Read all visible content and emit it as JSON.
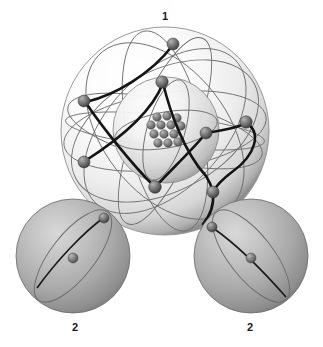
{
  "figure": {
    "title_present": false,
    "background_color": "#ffffff",
    "labels": [
      {
        "text": "1",
        "refers_to": "large-atom",
        "position": "top-center"
      },
      {
        "text": "2",
        "refers_to": "small-atom-left",
        "position": "bottom-left"
      },
      {
        "text": "2",
        "refers_to": "small-atom-right",
        "position": "bottom-right"
      }
    ],
    "label_1": "1",
    "label_2_left": "2",
    "label_2_right": "2"
  },
  "colors": {
    "background": "#ffffff",
    "outer_shell_light": "#fdfdfd",
    "outer_shell_mid": "#e2e2e2",
    "outer_shell_edge": "#9a9a9a",
    "inner_shell_light": "#f4f4f4",
    "inner_shell_mid": "#d2d2d2",
    "inner_shell_edge": "#8e8e8e",
    "small_sphere_light": "#c9c9c9",
    "small_sphere_mid": "#a5a5a5",
    "small_sphere_edge": "#6e6e6e",
    "electron_light": "#9b9b9b",
    "electron_dark": "#4a4a4a",
    "nucleon_light": "#a0a0a0",
    "nucleon_dark": "#545454",
    "orbit_thin": "#6a6a6a",
    "orbit_thick": "#141414",
    "label_text": "#1a1a1a"
  },
  "large_atom": {
    "name": "large-atom",
    "center_x": 165,
    "center_y": 131,
    "outer_shell_radius": 104,
    "inner_shell_center_x": 166,
    "inner_shell_center_y": 130,
    "inner_shell_radius": 53,
    "nucleus": {
      "center_x": 165,
      "center_y": 131,
      "nucleon_count": 13,
      "nucleon_radius": 4.3,
      "nucleons": [
        {
          "x": 157,
          "y": 117
        },
        {
          "x": 167,
          "y": 116
        },
        {
          "x": 177,
          "y": 118
        },
        {
          "x": 151,
          "y": 125
        },
        {
          "x": 161,
          "y": 125
        },
        {
          "x": 171,
          "y": 125
        },
        {
          "x": 181,
          "y": 126
        },
        {
          "x": 154,
          "y": 134
        },
        {
          "x": 164,
          "y": 134
        },
        {
          "x": 174,
          "y": 134
        },
        {
          "x": 158,
          "y": 143
        },
        {
          "x": 168,
          "y": 143
        },
        {
          "x": 178,
          "y": 142
        }
      ]
    },
    "electrons": [
      {
        "id": "e1",
        "x": 173,
        "y": 44,
        "r": 6.0
      },
      {
        "id": "e2",
        "x": 84,
        "y": 101,
        "r": 6.0
      },
      {
        "id": "e3",
        "x": 84,
        "y": 162,
        "r": 6.0
      },
      {
        "id": "e4",
        "x": 162,
        "y": 82,
        "r": 6.2
      },
      {
        "id": "e5",
        "x": 246,
        "y": 122,
        "r": 6.2
      },
      {
        "id": "e6",
        "x": 206,
        "y": 133,
        "r": 6.0
      },
      {
        "id": "e7",
        "x": 155,
        "y": 187,
        "r": 6.3
      },
      {
        "id": "e8",
        "x": 213,
        "y": 192,
        "r": 6.0
      }
    ],
    "orbit_count_thin": 7,
    "orbit_count_thick": 3
  },
  "small_atom_left": {
    "name": "small-atom-left",
    "center_x": 73,
    "center_y": 256,
    "radius": 57,
    "nucleus": {
      "x": 73,
      "y": 258,
      "r": 5.0
    },
    "electron": {
      "x": 104,
      "y": 218,
      "r": 5.0
    },
    "orbit_tilt_deg": -38
  },
  "small_atom_right": {
    "name": "small-atom-right",
    "center_x": 251,
    "center_y": 256,
    "radius": 57,
    "nucleus": {
      "x": 251,
      "y": 258,
      "r": 5.0
    },
    "electron": {
      "x": 212,
      "y": 227,
      "r": 5.0
    },
    "orbit_tilt_deg": 38
  }
}
